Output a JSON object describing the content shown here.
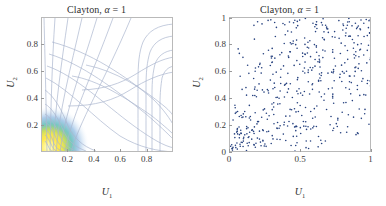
{
  "figure": {
    "width": 386,
    "height": 206,
    "background": "#ffffff"
  },
  "chart_data": [
    {
      "type": "contour",
      "panel": "left",
      "title": "Clayton, α = 1",
      "title_parts": {
        "name": "Clayton,",
        "param": "α",
        "equals": "=",
        "value": "1"
      },
      "xlabel": "U",
      "xlabel_sub": "1",
      "ylabel": "U",
      "ylabel_sub": "2",
      "xlim": [
        0,
        1
      ],
      "ylim": [
        0,
        1
      ],
      "xticks": [
        0.2,
        0.4,
        0.6,
        0.8
      ],
      "xticklabels": [
        "0.2",
        "0.4",
        "0.6",
        "0.8"
      ],
      "yticks": [
        0.2,
        0.4,
        0.6,
        0.8
      ],
      "yticklabels": [
        "0.2",
        "0.4",
        "0.6",
        "0.8"
      ],
      "grid": false,
      "legend": "none",
      "contour_line_color": "#aab6cf",
      "colormap": "parula",
      "density_peak": {
        "x": 0.02,
        "y": 0.02,
        "description": "high-density corner at origin"
      },
      "description": "Clayton copula density contours; density concentrates sharply at the lower-left corner (u1,u2 near 0) with contour lines fanning outward toward the upper-left and lower-right edges.",
      "contour_levels": [
        0.6,
        0.8,
        1.0,
        1.2,
        1.5,
        2,
        3,
        4,
        6,
        8,
        12,
        20,
        40
      ]
    },
    {
      "type": "scatter",
      "panel": "right",
      "title": "Clayton, α = 1",
      "title_parts": {
        "name": "Clayton,",
        "param": "α",
        "equals": "=",
        "value": "1"
      },
      "xlabel": "U",
      "xlabel_sub": "1",
      "ylabel": "U",
      "ylabel_sub": "2",
      "xlim": [
        0,
        1
      ],
      "ylim": [
        0,
        1
      ],
      "xticks": [
        0,
        0.5,
        1
      ],
      "xticklabels": [
        "0",
        "0.5",
        "1"
      ],
      "yticks": [
        0,
        0.2,
        0.4,
        0.6,
        0.8,
        1
      ],
      "yticklabels": [
        "0",
        "0.2",
        "0.4",
        "0.6",
        "0.8",
        "1"
      ],
      "grid": false,
      "legend": "none",
      "marker_color": "#26417f",
      "marker_size": 1.6,
      "n_points": 500,
      "description": "500 samples from a Clayton copula with alpha = 1, showing strong lower-tail dependence: a dense cluster of points near the origin and increasingly diffuse scatter toward the upper right."
    }
  ]
}
